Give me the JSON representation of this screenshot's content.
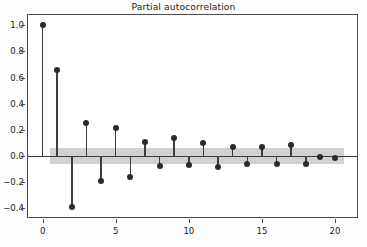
{
  "chart_data": {
    "type": "stem",
    "title": "Partial autocorrelation",
    "xlabel": "",
    "ylabel": "",
    "x": [
      0,
      1,
      2,
      3,
      4,
      5,
      6,
      7,
      8,
      9,
      10,
      11,
      12,
      13,
      14,
      15,
      16,
      17,
      18,
      19,
      20
    ],
    "values": [
      1.0,
      0.66,
      -0.395,
      0.25,
      -0.195,
      0.21,
      -0.16,
      0.105,
      -0.075,
      0.14,
      -0.07,
      0.1,
      -0.085,
      0.07,
      -0.065,
      0.07,
      -0.06,
      0.085,
      -0.065,
      -0.012,
      -0.018
    ],
    "xlim": [
      -1.0,
      21.5
    ],
    "ylim": [
      -0.47,
      1.08
    ],
    "xticks": [
      0,
      5,
      10,
      15,
      20
    ],
    "xtick_labels": [
      "0",
      "5",
      "10",
      "15",
      "20"
    ],
    "yticks": [
      -0.4,
      -0.2,
      0.0,
      0.2,
      0.4,
      0.6,
      0.8,
      1.0
    ],
    "ytick_labels": [
      "−0.4",
      "−0.2",
      "0.0",
      "0.2",
      "0.4",
      "0.6",
      "0.8",
      "1.0"
    ],
    "grid": false,
    "legend": null,
    "confidence_band": {
      "upper": 0.062,
      "lower": -0.062,
      "x_start": 0.5,
      "x_end": 20.6,
      "color": "#b4b4b4"
    },
    "zero_line": 0.0,
    "marker_color": "#2b2b2b",
    "stem_color": "#3d3d3d",
    "axis_color": "#4a4a4a",
    "background": "#ffffff"
  }
}
